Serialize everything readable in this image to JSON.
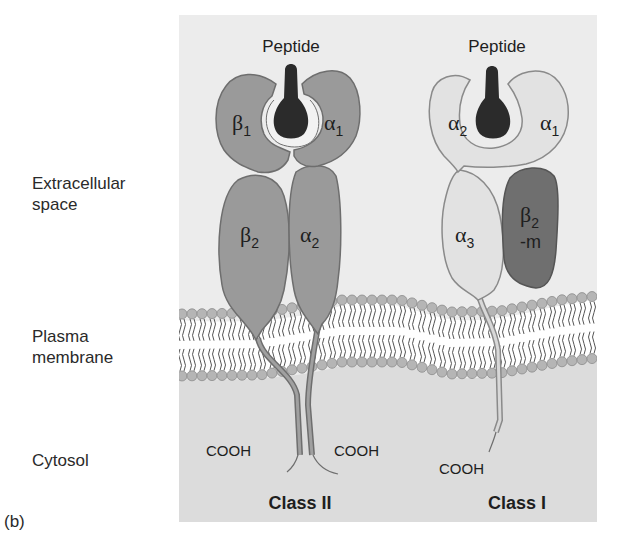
{
  "panel_label": "(b)",
  "regions": {
    "extracellular": [
      "Extracellular",
      "space"
    ],
    "membrane": [
      "Plasma",
      "membrane"
    ],
    "cytosol": "Cytosol"
  },
  "class_ii": {
    "title": "Class II",
    "peptide_label": "Peptide",
    "domains": {
      "beta1": {
        "greek": "β",
        "sub": "1"
      },
      "alpha1": {
        "greek": "α",
        "sub": "1"
      },
      "beta2": {
        "greek": "β",
        "sub": "2"
      },
      "alpha2": {
        "greek": "α",
        "sub": "2"
      }
    },
    "termini": [
      "COOH",
      "COOH"
    ]
  },
  "class_i": {
    "title": "Class I",
    "peptide_label": "Peptide",
    "domains": {
      "alpha2": {
        "greek": "α",
        "sub": "2"
      },
      "alpha1": {
        "greek": "α",
        "sub": "1"
      },
      "alpha3": {
        "greek": "α",
        "sub": "3"
      },
      "b2m": {
        "greek": "β",
        "sub": "2",
        "suffix": "-m"
      }
    },
    "termini": [
      "COOH"
    ]
  },
  "colors": {
    "panel_bg": "#ececec",
    "cytosol_bg": "#dcdcdc",
    "class_ii_fill": "#9a9a9a",
    "class_ii_stroke": "#6e6e6e",
    "class_i_fill": "#e2e2e2",
    "class_i_stroke": "#8a8a8a",
    "b2m_fill": "#6f6f6f",
    "peptide_fill": "#2b2b2b",
    "lipid_head": "#b5b5b5"
  }
}
